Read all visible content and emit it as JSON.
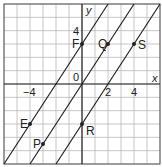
{
  "title": "",
  "axes": {
    "x_label": "x",
    "y_label": "y",
    "origin_label": "0",
    "x_range": [
      -6,
      6
    ],
    "y_range": [
      -6,
      6
    ],
    "x_ticks": [
      {
        "value": -4,
        "label": "−4"
      },
      {
        "value": 2,
        "label": "2"
      },
      {
        "value": 4,
        "label": "4"
      }
    ],
    "y_ticks": [
      {
        "value": 4,
        "label": "4"
      }
    ]
  },
  "lines": [
    {
      "name": "line-through-F-E",
      "slope": 1.5,
      "intercept": 3
    },
    {
      "name": "line-through-origin-Q-P",
      "slope": 1.5,
      "intercept": 0
    },
    {
      "name": "line-through-R-S",
      "slope": 1.5,
      "intercept": -3
    }
  ],
  "points": [
    {
      "label": "F",
      "x": 0,
      "y": 3,
      "anchor": "left"
    },
    {
      "label": "Q",
      "x": 2,
      "y": 3,
      "anchor": "left"
    },
    {
      "label": "S",
      "x": 4,
      "y": 3,
      "anchor": "right"
    },
    {
      "label": "E",
      "x": -4,
      "y": -3,
      "anchor": "left"
    },
    {
      "label": "R",
      "x": 0,
      "y": -3,
      "anchor": "right-below"
    },
    {
      "label": "P",
      "x": -3,
      "y": -4.5,
      "anchor": "left"
    }
  ],
  "colors": {
    "grid": "#b8b8b8",
    "axis": "#222222",
    "line": "#222222",
    "frame": "#555555"
  }
}
